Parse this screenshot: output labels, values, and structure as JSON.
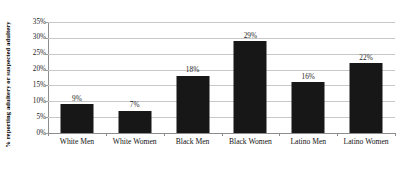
{
  "chart_data": {
    "type": "bar",
    "title": "",
    "subtitle": "",
    "xlabel": "",
    "ylabel": "% reporting adultery or suspected adultery",
    "categories": [
      "White Men",
      "White Women",
      "Black Men",
      "Black Women",
      "Latino Men",
      "Latino Women"
    ],
    "values": [
      9,
      7,
      18,
      29,
      16,
      22
    ],
    "data_labels": [
      "9%",
      "7%",
      "18%",
      "29%",
      "16%",
      "22%"
    ],
    "ylim": [
      0,
      35
    ],
    "y_ticks": [
      35,
      30,
      25,
      20,
      15,
      10,
      5,
      0
    ],
    "y_tick_labels": [
      "35%",
      "30%",
      "25%",
      "20%",
      "15%",
      "10%",
      "5%",
      "0%"
    ],
    "grid": true,
    "grid_axis": "y",
    "legend": false,
    "legend_position": "none",
    "series": [
      {
        "name": "% reporting adultery or suspected adultery",
        "values": [
          9,
          7,
          18,
          29,
          16,
          22
        ],
        "color": "#171717"
      }
    ],
    "colors": {
      "bar": "#171717",
      "gridline": "#c8c8c8",
      "axis": "#8d8d8d",
      "background": "#ffffff",
      "text": "#141414"
    }
  }
}
